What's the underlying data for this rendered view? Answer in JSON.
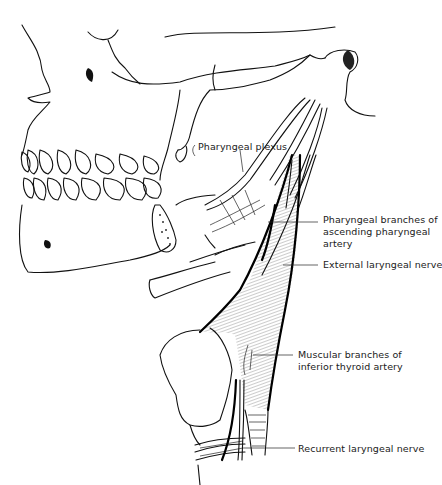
{
  "figure": {
    "labels": {
      "pharyngeal_plexus": "Pharyngeal plexus",
      "pharyngeal_branches_1": "Pharyngeal branches of",
      "pharyngeal_branches_2": "ascending pharyngeal",
      "pharyngeal_branches_3": "artery",
      "external_laryngeal": "External laryngeal nerve",
      "muscular_branches_1": "Muscular branches of",
      "muscular_branches_2": "inferior thyroid artery",
      "recurrent_laryngeal": "Recurrent laryngeal nerve"
    },
    "colors": {
      "ink": "#111111",
      "background": "#ffffff"
    }
  }
}
